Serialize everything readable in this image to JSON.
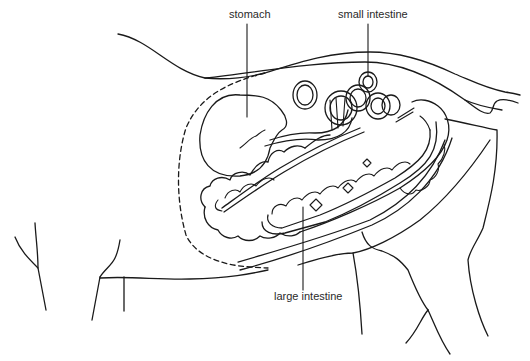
{
  "diagram": {
    "labels": {
      "stomach": "stomach",
      "small_intestine": "small intestine",
      "large_intestine": "large intestine"
    },
    "colors": {
      "line": "#1a1a1a",
      "text": "#2a2a2a",
      "background": "#ffffff"
    }
  }
}
